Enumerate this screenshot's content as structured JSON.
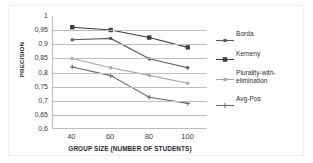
{
  "chart_data": {
    "type": "line",
    "title": "",
    "xlabel": "GROUP SIZE (NUMBER OF STUDENTS)",
    "ylabel": "PRECISION",
    "categories": [
      40,
      60,
      80,
      100
    ],
    "x_tick_labels": [
      "40",
      "60",
      "80",
      "100"
    ],
    "y_tick_labels": [
      "1",
      "0,95",
      "0,9",
      "0,85",
      "0,8",
      "0,75",
      "0,7",
      "0,65",
      "0,6"
    ],
    "y_tick_values": [
      1,
      0.95,
      0.9,
      0.85,
      0.8,
      0.75,
      0.7,
      0.65,
      0.6
    ],
    "ylim": [
      0.6,
      1.0
    ],
    "grid": true,
    "legend_position": "right",
    "series": [
      {
        "name": "Borda",
        "values": [
          0.915,
          0.92,
          0.847,
          0.815
        ],
        "color": "#595959",
        "marker": "small-square"
      },
      {
        "name": "Kemeny",
        "values": [
          0.96,
          0.95,
          0.923,
          0.888
        ],
        "color": "#3f3f3f",
        "marker": "filled-square"
      },
      {
        "name": "Plurality-with-\nelimination",
        "values": [
          0.848,
          0.815,
          0.788,
          0.76
        ],
        "color": "#a6a6a6",
        "marker": "small-square"
      },
      {
        "name": "Avg-Pos",
        "values": [
          0.818,
          0.787,
          0.71,
          0.688
        ],
        "color": "#6e6e6e",
        "marker": "cross"
      }
    ]
  }
}
